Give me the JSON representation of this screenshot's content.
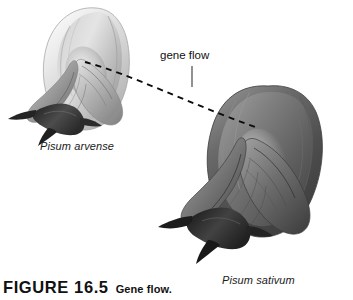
{
  "figure": {
    "background_color": "#ffffff",
    "caption": {
      "number": "FIGURE 16.5",
      "title": "Gene flow."
    },
    "annotation": {
      "gene_flow_label": "gene flow",
      "leader_line": "vertical-leader-line",
      "flow_path": "dashed-arc"
    },
    "specimens": [
      {
        "name": "Pisum arvense",
        "position": "left",
        "tone": "light-gray",
        "icon": "pea-flower-icon"
      },
      {
        "name": "Pisum sativum",
        "position": "right",
        "tone": "dark-gray",
        "icon": "pea-flower-icon"
      }
    ],
    "colors": {
      "ink": "#111111",
      "dash": "#0d0d0d",
      "light_petal": "#d8d8d8",
      "mid_petal": "#9a9a9a",
      "dark_petal": "#4a4a4a",
      "sepal": "#2e2e2e"
    }
  }
}
